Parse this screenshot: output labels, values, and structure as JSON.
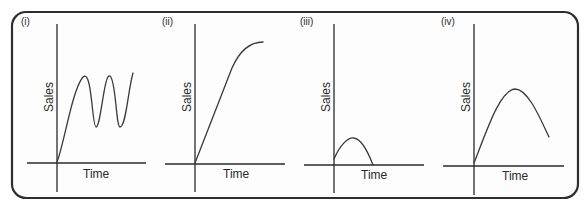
{
  "figure": {
    "frame": {
      "x": 12,
      "y": 12,
      "width": 566,
      "height": 186,
      "radius": 14,
      "stroke": "#2e2e2e"
    },
    "line_color": "#2a2a2a"
  },
  "panels": [
    {
      "id": "i",
      "label": "(i)",
      "label_pos": [
        21,
        25
      ],
      "xlabel": "Time",
      "ylabel": "Sales",
      "y_axis": {
        "x": 57,
        "y1": 24,
        "y2": 192
      },
      "x_axis": {
        "y": 163,
        "x1": 27,
        "x2": 146
      },
      "xlabel_pos": [
        83,
        178
      ],
      "ylabel_pos": [
        53,
        97
      ],
      "curve_description": "Rises then oscillates with repeated peaks and troughs (scalloped / cyclical)",
      "curve_path": "M57,162 C64,145 72,90 83,77 C92,68 92,127 96,127 C101,127 104,72 110,76 C116,80 116,127 120,127 C126,127 128,90 133,73"
    },
    {
      "id": "ii",
      "label": "(ii)",
      "label_pos": [
        162,
        25
      ],
      "xlabel": "Time",
      "ylabel": "Sales",
      "y_axis": {
        "x": 195,
        "y1": 24,
        "y2": 192
      },
      "x_axis": {
        "y": 164,
        "x1": 165,
        "x2": 285
      },
      "xlabel_pos": [
        223,
        178
      ],
      "ylabel_pos": [
        191,
        97
      ],
      "curve_description": "Rapid linear rise that levels off to a plateau",
      "curve_path": "M195,163 L232,68 C240,50 250,42 263,42"
    },
    {
      "id": "iii",
      "label": "(iii)",
      "label_pos": [
        300,
        25
      ],
      "xlabel": "Time",
      "ylabel": "Sales",
      "y_axis": {
        "x": 334,
        "y1": 24,
        "y2": 193
      },
      "x_axis": {
        "y": 165,
        "x1": 304,
        "x2": 424
      },
      "xlabel_pos": [
        361,
        179
      ],
      "ylabel_pos": [
        330,
        97
      ],
      "curve_description": "Small short-lived hump; rises briefly then falls back to zero",
      "curve_path": "M334,159 C340,145 348,137 354,138 C362,139 368,152 373,165"
    },
    {
      "id": "iv",
      "label": "(iv)",
      "label_pos": [
        441,
        25
      ],
      "xlabel": "Time",
      "ylabel": "Sales",
      "y_axis": {
        "x": 474,
        "y1": 24,
        "y2": 195
      },
      "x_axis": {
        "y": 166,
        "x1": 443,
        "x2": 564
      },
      "xlabel_pos": [
        502,
        180
      ],
      "ylabel_pos": [
        470,
        97
      ],
      "curve_description": "Rises to a single peak then declines",
      "curve_path": "M474,163 C487,130 500,90 515,89 C528,89 540,118 549,137"
    }
  ]
}
